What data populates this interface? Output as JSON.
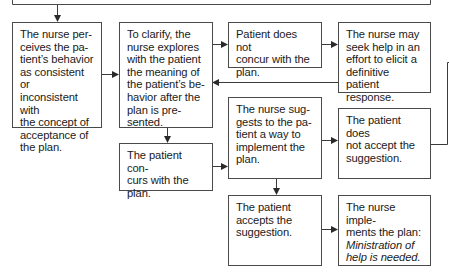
{
  "diagram": {
    "top_box": {
      "text": ""
    },
    "nodes": [
      {
        "id": "perceive",
        "text": "The nurse perceives the patient’s behavior as consistent or inconsistent with the concept of acceptance of the plan."
      },
      {
        "id": "clarify",
        "text": "To clarify, the nurse explores with the patient the meaning of the patient’s behavior after the plan is presented."
      },
      {
        "id": "not_concur",
        "text": "Patient does not concur with the plan."
      },
      {
        "id": "seek_help",
        "text": "The nurse may seek help in an effort to elicit a definitive patient response."
      },
      {
        "id": "concurs",
        "text": "The patient concurs with the plan."
      },
      {
        "id": "suggests",
        "text": "The nurse suggests to the patient a way to implement the plan."
      },
      {
        "id": "not_accept",
        "text": "The patient does not accept the suggestion."
      },
      {
        "id": "accepts",
        "text": "The patient accepts the suggestion."
      },
      {
        "id": "implements",
        "text": "The nurse implements the plan:",
        "italic": "Ministration of help is needed."
      }
    ],
    "lines_display": {
      "perceive": [
        "The nurse per-",
        "ceives the pa-",
        "tient’s behavior",
        "as consistent or",
        "inconsistent with",
        "the concept of",
        "acceptance of",
        "the plan."
      ],
      "clarify": [
        "To clarify, the",
        "nurse explores",
        "with the patient",
        "the meaning of",
        "the patient’s be-",
        "havior after the",
        "plan is pre-",
        "sented."
      ],
      "not_concur": [
        "Patient does not",
        "concur with the",
        "plan."
      ],
      "seek_help": [
        "The nurse may",
        "seek help in an",
        "effort to elicit a",
        "definitive patient",
        "response."
      ],
      "concurs": [
        "The patient con-",
        "curs with the",
        "plan."
      ],
      "suggests": [
        "The nurse sug-",
        "gests to the pa-",
        "tient a way to",
        "implement the",
        "plan."
      ],
      "not_accept": [
        "The patient does",
        "not accept the",
        "suggestion."
      ],
      "accepts": [
        "The patient",
        "accepts the",
        "suggestion."
      ],
      "implements": [
        "The nurse imple-",
        "ments the plan:",
        "Ministration of",
        "help is needed."
      ]
    },
    "colors": {
      "line": "#3a3a3a",
      "border": "#4a4a4a",
      "text": "#1a1a1a"
    }
  }
}
